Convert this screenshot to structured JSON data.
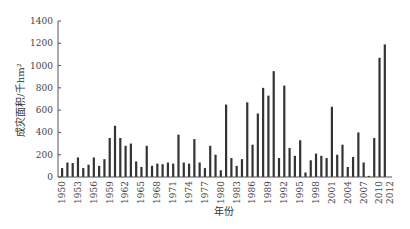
{
  "chart_data": {
    "type": "bar",
    "title": "",
    "xlabel": "年份",
    "ylabel": "成灾面积/千hm²",
    "ylim": [
      0,
      1400
    ],
    "yticks": [
      0,
      200,
      400,
      600,
      800,
      1000,
      1200,
      1400
    ],
    "grid": false,
    "legend": null,
    "xtick_labels": [
      "1950",
      "1953",
      "1956",
      "1959",
      "1962",
      "1965",
      "1968",
      "1971",
      "1974",
      "1977",
      "1980",
      "1983",
      "1986",
      "1989",
      "1992",
      "1995",
      "1998",
      "2001",
      "2004",
      "2007",
      "2010",
      "2012"
    ],
    "categories": [
      1950,
      1951,
      1952,
      1953,
      1954,
      1955,
      1956,
      1957,
      1958,
      1959,
      1960,
      1961,
      1962,
      1963,
      1964,
      1965,
      1966,
      1967,
      1968,
      1969,
      1970,
      1971,
      1972,
      1973,
      1974,
      1975,
      1976,
      1977,
      1978,
      1979,
      1980,
      1981,
      1982,
      1983,
      1984,
      1985,
      1986,
      1987,
      1988,
      1989,
      1990,
      1991,
      1992,
      1993,
      1994,
      1995,
      1996,
      1997,
      1998,
      1999,
      2000,
      2001,
      2002,
      2003,
      2004,
      2005,
      2006,
      2007,
      2008,
      2009,
      2010,
      2011,
      2012
    ],
    "values": [
      80,
      130,
      125,
      175,
      80,
      110,
      175,
      100,
      160,
      350,
      460,
      350,
      280,
      300,
      140,
      90,
      280,
      100,
      120,
      115,
      130,
      120,
      380,
      130,
      120,
      340,
      130,
      80,
      280,
      200,
      60,
      650,
      170,
      100,
      160,
      670,
      290,
      570,
      800,
      730,
      950,
      170,
      820,
      260,
      190,
      330,
      40,
      150,
      210,
      190,
      170,
      630,
      200,
      290,
      90,
      180,
      400,
      130,
      10,
      350,
      1070,
      1190,
      0
    ]
  }
}
